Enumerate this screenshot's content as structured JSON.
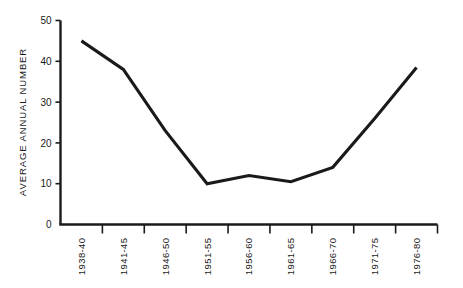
{
  "chart_data": {
    "type": "line",
    "title": "",
    "subtitle": "",
    "xlabel": "",
    "ylabel": "AVERAGE ANNUAL NUMBER",
    "categories": [
      "1938-40",
      "1941-45",
      "1946-50",
      "1951-55",
      "1956-60",
      "1961-65",
      "1966-70",
      "1971-75",
      "1976-80"
    ],
    "values": [
      45,
      38,
      23,
      10,
      12,
      10.5,
      14,
      26,
      38.5
    ],
    "series": [
      {
        "name": "Average annual number",
        "values": [
          45,
          38,
          23,
          10,
          12,
          10.5,
          14,
          26,
          38.5
        ]
      }
    ],
    "ylim": [
      0,
      50
    ],
    "ytick_labels": [
      "0",
      "10",
      "20",
      "30",
      "40",
      "50"
    ],
    "ytick_values": [
      0,
      10,
      20,
      30,
      40,
      50
    ],
    "grid": false,
    "legend": false,
    "legend_position": "none",
    "line_color": "#1a1a1a",
    "axis_color": "#1a1a1a",
    "background_color": "#ffffff",
    "annotations": []
  },
  "axes": {
    "y_axis_title": "AVERAGE ANNUAL NUMBER",
    "y_ticks": [
      {
        "label": "50",
        "value": 50
      },
      {
        "label": "40",
        "value": 40
      },
      {
        "label": "30",
        "value": 30
      },
      {
        "label": "20",
        "value": 20
      },
      {
        "label": "10",
        "value": 10
      },
      {
        "label": "0",
        "value": 0
      }
    ],
    "x_ticks": [
      {
        "label": "1938-40"
      },
      {
        "label": "1941-45"
      },
      {
        "label": "1946-50"
      },
      {
        "label": "1951-55"
      },
      {
        "label": "1956-60"
      },
      {
        "label": "1961-65"
      },
      {
        "label": "1966-70"
      },
      {
        "label": "1971-75"
      },
      {
        "label": "1976-80"
      }
    ]
  }
}
